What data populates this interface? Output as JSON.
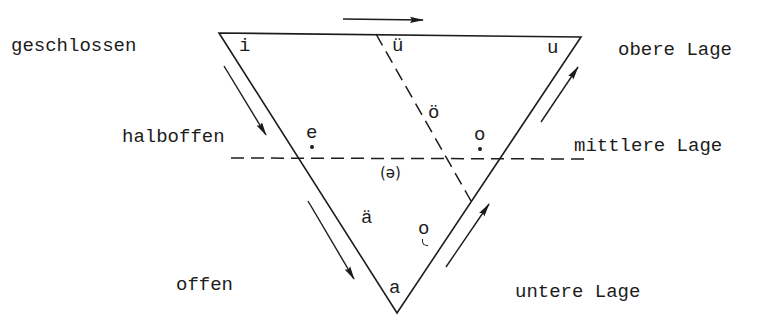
{
  "diagram": {
    "title": "",
    "type": "vowel-triangle",
    "colors": {
      "line": "#1c1c1c",
      "background": "#ffffff"
    },
    "left_labels": {
      "closed": "geschlossen",
      "half_open": "halboffen",
      "open": "offen"
    },
    "right_labels": {
      "upper": "obere Lage",
      "middle": "mittlere Lage",
      "lower": "untere Lage"
    },
    "vowels": {
      "i": "i",
      "ue": "ü",
      "u": "u",
      "oe": "ö",
      "e_closed": "e",
      "o_closed": "o",
      "schwa": "(ə)",
      "ae": "ä",
      "o_open": "o",
      "a": "a"
    },
    "vowel_notes": {
      "e_closed": "dot below",
      "o_closed": "dot below",
      "o_open": "hook below"
    },
    "arrows": [
      {
        "name": "top-arrow",
        "direction": "right"
      },
      {
        "name": "left-upper-arrow",
        "direction": "down-right"
      },
      {
        "name": "left-lower-arrow",
        "direction": "down-right"
      },
      {
        "name": "right-lower-arrow",
        "direction": "up-right"
      },
      {
        "name": "right-upper-arrow",
        "direction": "up-right"
      }
    ]
  }
}
